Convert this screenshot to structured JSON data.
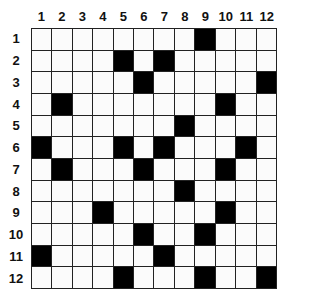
{
  "puzzle": {
    "rows": 12,
    "cols": 12,
    "column_labels": [
      "1",
      "2",
      "3",
      "4",
      "5",
      "6",
      "7",
      "8",
      "9",
      "10",
      "11",
      "12"
    ],
    "row_labels": [
      "1",
      "2",
      "3",
      "4",
      "5",
      "6",
      "7",
      "8",
      "9",
      "10",
      "11",
      "12"
    ],
    "black_cells": [
      [
        1,
        9
      ],
      [
        2,
        5
      ],
      [
        2,
        7
      ],
      [
        3,
        6
      ],
      [
        3,
        12
      ],
      [
        4,
        2
      ],
      [
        4,
        10
      ],
      [
        5,
        8
      ],
      [
        6,
        1
      ],
      [
        6,
        5
      ],
      [
        6,
        7
      ],
      [
        6,
        11
      ],
      [
        7,
        2
      ],
      [
        7,
        6
      ],
      [
        7,
        10
      ],
      [
        8,
        8
      ],
      [
        9,
        4
      ],
      [
        9,
        10
      ],
      [
        10,
        6
      ],
      [
        10,
        9
      ],
      [
        11,
        1
      ],
      [
        11,
        7
      ],
      [
        12,
        5
      ],
      [
        12,
        9
      ],
      [
        12,
        12
      ]
    ],
    "colors": {
      "black": "#000000",
      "white": "#fbfbfb",
      "line": "#222222"
    }
  }
}
